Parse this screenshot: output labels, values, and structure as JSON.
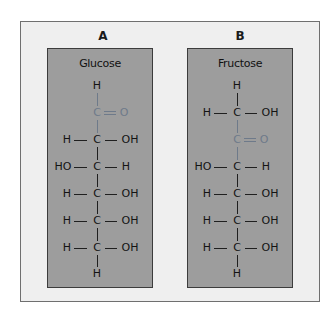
{
  "figure": {
    "panels": [
      {
        "label": "A",
        "title": "Glucose",
        "structure": {
          "top": "H",
          "rows": [
            {
              "left": "",
              "center": "C",
              "right": "O",
              "bond": "double",
              "highlight": true
            },
            {
              "left": "H",
              "center": "C",
              "right": "OH",
              "bond": "single",
              "highlight": false
            },
            {
              "left": "HO",
              "center": "C",
              "right": "H",
              "bond": "single",
              "highlight": false
            },
            {
              "left": "H",
              "center": "C",
              "right": "OH",
              "bond": "single",
              "highlight": false
            },
            {
              "left": "H",
              "center": "C",
              "right": "OH",
              "bond": "single",
              "highlight": false
            },
            {
              "left": "H",
              "center": "C",
              "right": "OH",
              "bond": "single",
              "highlight": false
            }
          ],
          "bottom": "H"
        }
      },
      {
        "label": "B",
        "title": "Fructose",
        "structure": {
          "top": "H",
          "rows": [
            {
              "left": "H",
              "center": "C",
              "right": "OH",
              "bond": "single",
              "highlight": false
            },
            {
              "left": "",
              "center": "C",
              "right": "O",
              "bond": "double",
              "highlight": true
            },
            {
              "left": "HO",
              "center": "C",
              "right": "H",
              "bond": "single",
              "highlight": false
            },
            {
              "left": "H",
              "center": "C",
              "right": "OH",
              "bond": "single",
              "highlight": false
            },
            {
              "left": "H",
              "center": "C",
              "right": "OH",
              "bond": "single",
              "highlight": false
            },
            {
              "left": "H",
              "center": "C",
              "right": "OH",
              "bond": "single",
              "highlight": false
            }
          ],
          "bottom": "H"
        }
      }
    ],
    "colors": {
      "frame_bg": "#efefef",
      "box_bg": "#9d9d9d",
      "text": "#141414",
      "carbonyl_accent": "#6e7a8a"
    }
  }
}
